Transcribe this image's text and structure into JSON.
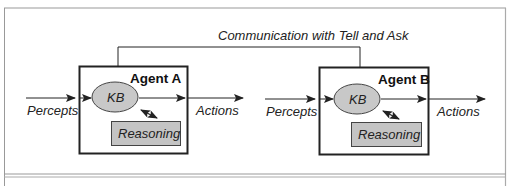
{
  "diagram": {
    "communication_label": "Communication with Tell and Ask",
    "agents": [
      {
        "title": "Agent A",
        "kb_label": "KB",
        "reasoning_label": "Reasoning",
        "input_label": "Percepts",
        "output_label": "Actions"
      },
      {
        "title": "Agent B",
        "kb_label": "KB",
        "reasoning_label": "Reasoning",
        "input_label": "Percepts",
        "output_label": "Actions"
      }
    ],
    "colors": {
      "line": "#222222",
      "kb_fill": "#c8c8c8",
      "reasoning_fill": "#c4c4c4",
      "frame": "#999999"
    }
  }
}
